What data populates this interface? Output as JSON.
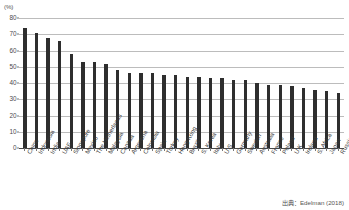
{
  "unit_label": "(%)",
  "source_note": "出典：Edelman (2018)",
  "chart_data": {
    "type": "bar",
    "title": "",
    "subtitle": "",
    "xlabel": "",
    "ylabel": "(%)",
    "ylim": [
      0,
      80
    ],
    "yticks": [
      0,
      10,
      20,
      30,
      40,
      50,
      60,
      70,
      80
    ],
    "ytick_labels": [
      "0",
      "10",
      "20",
      "30",
      "40",
      "50",
      "60",
      "70",
      "80"
    ],
    "grid": true,
    "legend": "none",
    "bar_color": "#2e2e2e",
    "grid_color": "#bcbcbc",
    "categories": [
      "China",
      "Indonesia",
      "India",
      "UAE",
      "Singapore",
      "Mexico",
      "The Netherlands",
      "Malaysia",
      "Canada",
      "Argentina",
      "Colombia",
      "Spain",
      "Turkey",
      "Hong Kong",
      "Brazil",
      "S. Korea",
      "Italy",
      "U.S.",
      "Germany",
      "Sweden",
      "Australia",
      "France",
      "Poland",
      "U.K.",
      "Ireland",
      "S. Africa",
      "Japan",
      "Russia"
    ],
    "values": [
      74,
      71,
      68,
      66,
      58,
      53,
      53,
      52,
      48,
      46,
      46,
      46,
      45,
      45,
      44,
      44,
      43,
      43,
      42,
      42,
      40,
      39,
      39,
      38,
      37,
      36,
      35,
      34
    ]
  }
}
